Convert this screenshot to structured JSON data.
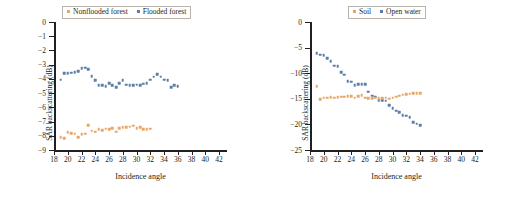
{
  "figure": {
    "panels": [
      "left",
      "right"
    ]
  },
  "colors": {
    "blue": "#5b7fa6",
    "orange": "#e8a765",
    "axis": "#231f20",
    "legend_border": "#b9b3ab",
    "background": "#ffffff"
  },
  "chart_data": [
    {
      "type": "scatter",
      "id": "left-panel",
      "title": "",
      "xlabel": "Incidence angle",
      "ylabel": "SAR backscattering (dB)",
      "xlim": [
        18,
        43
      ],
      "ylim": [
        -9,
        0
      ],
      "grid": false,
      "legend_position": "top-center",
      "xticks": [
        18,
        20,
        22,
        24,
        26,
        28,
        30,
        32,
        34,
        36,
        38,
        40,
        42
      ],
      "yticks": [
        0,
        -1,
        -2,
        -3,
        -4,
        -5,
        -6,
        -7,
        -8,
        -9
      ],
      "ytick_labels": [
        "0",
        "−1",
        "−2",
        "−3",
        "−4",
        "−5",
        "−6",
        "−7",
        "−8",
        "−9"
      ],
      "xtick_labels": [
        "18",
        "20",
        "22",
        "24",
        "26",
        "28",
        "30",
        "32",
        "34",
        "36",
        "38",
        "40",
        "42"
      ],
      "x": [
        19,
        19.5,
        20,
        20.5,
        21,
        21.5,
        22,
        22.5,
        23,
        23.5,
        24,
        24.5,
        25,
        25.5,
        26,
        26.5,
        27,
        27.5,
        28,
        28.5,
        29,
        29.5,
        30,
        30.5,
        31,
        31.5,
        32,
        32.5,
        33,
        33.5,
        34,
        34.5,
        35,
        35.5,
        36,
        36.5,
        37,
        37.5,
        38,
        38.5,
        39,
        39.5,
        40,
        40.5,
        41,
        41.5,
        42
      ],
      "series": [
        {
          "name": "Flooded forest",
          "color": "#5b7fa6",
          "values": [
            -4.05,
            -3.62,
            -3.6,
            -3.57,
            -3.55,
            -3.45,
            -3.25,
            -3.22,
            -3.3,
            -3.83,
            -4.1,
            -4.45,
            -4.45,
            -4.5,
            -4.3,
            -4.45,
            -4.6,
            -4.3,
            -4.1,
            -4.4,
            -4.45,
            -4.45,
            -4.4,
            -4.45,
            -4.35,
            -4.3,
            -4.05,
            -3.85,
            -3.65,
            -3.85,
            -4.05,
            -4.1,
            -4.6,
            -4.45,
            -4.5
          ]
        },
        {
          "name": "Nonflooded forest",
          "color": "#e8a765",
          "values": [
            -8.1,
            -8.15,
            -7.75,
            -7.8,
            -7.85,
            -8.1,
            -7.9,
            -7.85,
            -7.25,
            -7.65,
            -7.7,
            -7.55,
            -7.6,
            -7.5,
            -7.55,
            -7.45,
            -7.7,
            -7.45,
            -7.4,
            -7.4,
            -7.35,
            -7.3,
            -7.45,
            -7.4,
            -7.55,
            -7.55,
            -7.5
          ]
        }
      ]
    },
    {
      "type": "scatter",
      "id": "right-panel",
      "title": "",
      "xlabel": "Incidence angle",
      "ylabel": "SAR backscattering (dB)",
      "xlim": [
        18,
        43
      ],
      "ylim": [
        -25,
        0
      ],
      "grid": false,
      "legend_position": "top-center",
      "xticks": [
        18,
        20,
        22,
        24,
        26,
        28,
        30,
        32,
        34,
        36,
        38,
        40,
        42
      ],
      "yticks": [
        0,
        -5,
        -10,
        -15,
        -20,
        -25
      ],
      "ytick_labels": [
        "0",
        "−5",
        "−10",
        "−15",
        "−20",
        "−25"
      ],
      "xtick_labels": [
        "18",
        "20",
        "22",
        "24",
        "26",
        "28",
        "30",
        "32",
        "34",
        "36",
        "38",
        "40",
        "42"
      ],
      "x": [
        19,
        19.5,
        20,
        20.5,
        21,
        21.5,
        22,
        22.5,
        23,
        23.5,
        24,
        24.5,
        25,
        25.5,
        26,
        26.5,
        27,
        27.5,
        28,
        28.5,
        29,
        29.5,
        30,
        30.5,
        31,
        31.5,
        32,
        32.5,
        33,
        33.5,
        34,
        34.5,
        35,
        35.5,
        36,
        36.5,
        37,
        37.5,
        38,
        38.5,
        39,
        39.5,
        40,
        40.5,
        41,
        41.5,
        42
      ],
      "series": [
        {
          "name": "Open water",
          "color": "#5b7fa6",
          "values": [
            -6.1,
            -6.4,
            -6.45,
            -7.1,
            -7.6,
            -8.5,
            -8.6,
            -9.8,
            -10.3,
            -11.6,
            -11.7,
            -12.3,
            -12.2,
            -12.2,
            -12.1,
            -13.6,
            -14.4,
            -14.6,
            -15.3,
            -15.3,
            -15.4,
            -16.2,
            -16.8,
            -17.3,
            -17.6,
            -18.2,
            -18.3,
            -18.6,
            -19.6,
            -19.9,
            -20.2
          ]
        },
        {
          "name": "Soil",
          "color": "#e8a765",
          "values": [
            -12.5,
            -15.1,
            -14.8,
            -14.8,
            -14.7,
            -14.75,
            -14.7,
            -14.6,
            -14.6,
            -14.5,
            -14.45,
            -14.75,
            -14.5,
            -14.3,
            -14.8,
            -14.85,
            -14.85,
            -14.75,
            -14.85,
            -14.9,
            -14.8,
            -14.95,
            -14.75,
            -14.6,
            -14.4,
            -14.2,
            -14.05,
            -14.0,
            -13.9,
            -13.85,
            -13.85
          ]
        }
      ]
    }
  ]
}
